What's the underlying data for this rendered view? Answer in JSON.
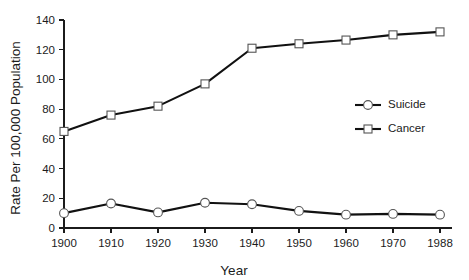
{
  "chart_data": {
    "type": "line",
    "title": "",
    "xlabel": "Year",
    "ylabel": "Rate Per 100,000 Population",
    "x": [
      1900,
      1910,
      1920,
      1930,
      1940,
      1950,
      1960,
      1970,
      1988
    ],
    "categories": [
      "1900",
      "1910",
      "1920",
      "1930",
      "1940",
      "1950",
      "1960",
      "1970",
      "1988"
    ],
    "series": [
      {
        "name": "Suicide",
        "marker": "circle",
        "values": [
          10,
          16.5,
          10.5,
          17,
          16,
          11.5,
          9,
          9.5,
          9
        ]
      },
      {
        "name": "Cancer",
        "marker": "square",
        "values": [
          65,
          76,
          82,
          97,
          121,
          124,
          126.5,
          130,
          132
        ]
      }
    ],
    "xtick_labels": [
      "1900",
      "1910",
      "1920",
      "1930",
      "1940",
      "1950",
      "1960",
      "1970",
      "1988"
    ],
    "ytick_labels": [
      "0",
      "20",
      "40",
      "60",
      "80",
      "100",
      "120",
      "140"
    ],
    "ytick_values": [
      0,
      20,
      40,
      60,
      80,
      100,
      120,
      140
    ],
    "ylim": [
      0,
      140
    ],
    "xlim": [
      1900,
      1988
    ],
    "grid": false,
    "legend_position": "center-right",
    "legend_entries": [
      "Suicide",
      "Cancer"
    ],
    "line_color": "#111111",
    "marker_fill": "#ffffff",
    "marker_stroke": "#555555",
    "axis_color": "#1b1b1b",
    "background_color": "#ffffff"
  }
}
